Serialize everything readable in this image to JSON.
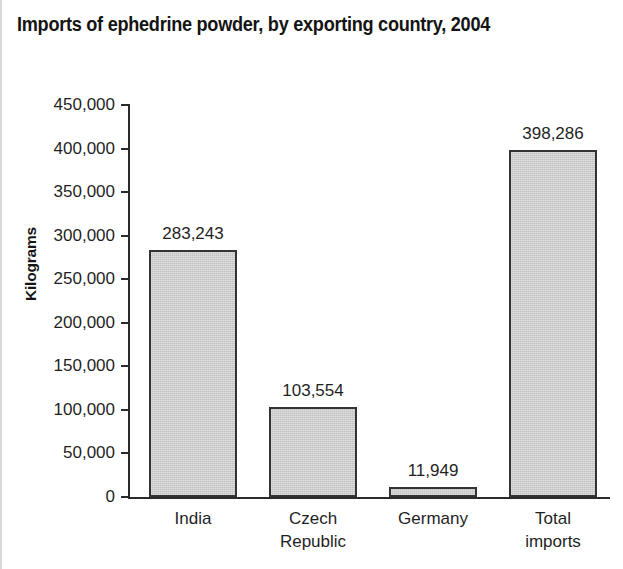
{
  "chart_data": {
    "type": "bar",
    "title": "Imports of ephedrine powder, by exporting country, 2004",
    "xlabel": "",
    "ylabel": "Kilograms",
    "categories": [
      "India",
      "Czech\nRepublic",
      "Germany",
      "Total imports"
    ],
    "values": [
      283243,
      103554,
      11949,
      398286
    ],
    "value_labels": [
      "283,243",
      "103,554",
      "11,949",
      "398,286"
    ],
    "ylim": [
      0,
      450000
    ],
    "ytick_values": [
      0,
      50000,
      100000,
      150000,
      200000,
      250000,
      300000,
      350000,
      400000,
      450000
    ],
    "ytick_labels": [
      "0",
      "50,000",
      "100,000",
      "150,000",
      "200,000",
      "250,000",
      "300,000",
      "350,000",
      "400,000",
      "450,000"
    ],
    "grid": false,
    "legend": false,
    "bar_fill_color": "#c2c2c2",
    "bar_border_color": "#333333",
    "axis_color": "#2b2b2b",
    "background_color": "#ffffff",
    "text_color": "#1f1f1f"
  }
}
